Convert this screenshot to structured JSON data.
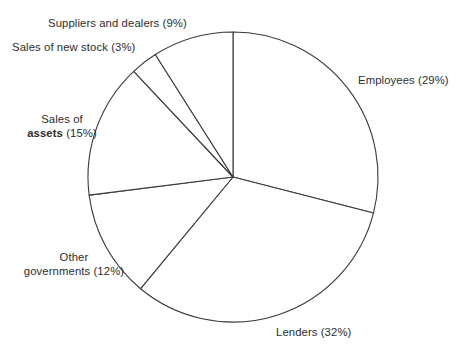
{
  "chart_data": {
    "type": "pie",
    "title": "",
    "subtitle": "",
    "xlabel": "",
    "ylabel": "",
    "grid": false,
    "legend_position": "none",
    "labels_position": "outside",
    "units": "percent",
    "start_angle_deg": 0,
    "direction": "clockwise",
    "center": {
      "x": 233,
      "y": 177
    },
    "radius": 145,
    "slice_fill": "#ffffff",
    "slice_stroke": "#3a3a3a",
    "categories": [
      "Employees",
      "Lenders",
      "Other governments",
      "Sales of assets",
      "Sales of new stock",
      "Suppliers and dealers"
    ],
    "values": [
      29,
      32,
      12,
      15,
      3,
      9
    ],
    "slices": [
      {
        "name": "Employees",
        "value": 29,
        "label": "Employees (29%)",
        "start_deg": 0,
        "end_deg": 104.4
      },
      {
        "name": "Lenders",
        "value": 32,
        "label": "Lenders (32%)",
        "start_deg": 104.4,
        "end_deg": 219.6
      },
      {
        "name": "Other governments",
        "value": 12,
        "label": "Other governments (12%)",
        "start_deg": 219.6,
        "end_deg": 262.8
      },
      {
        "name": "Sales of assets",
        "value": 15,
        "label": "Sales of assets (15%)",
        "start_deg": 262.8,
        "end_deg": 316.8
      },
      {
        "name": "Sales of new stock",
        "value": 3,
        "label": "Sales of new stock (3%)",
        "start_deg": 316.8,
        "end_deg": 327.6
      },
      {
        "name": "Suppliers and dealers",
        "value": 9,
        "label": "Suppliers and dealers (9%)",
        "start_deg": 327.6,
        "end_deg": 360
      }
    ]
  },
  "labels": {
    "suppliers": "Suppliers and dealers (9%)",
    "new_stock": "Sales of new stock (3%)",
    "assets_line1": "Sales of",
    "assets_word": "assets",
    "assets_pct": " (15%)",
    "othergov_line1": "Other",
    "othergov_line2": "governments (12%)",
    "lenders": "Lenders (32%)",
    "employees": "Employees (29%)"
  }
}
